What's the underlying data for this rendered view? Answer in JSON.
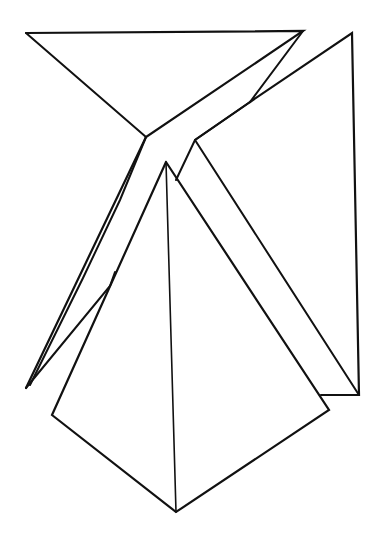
{
  "figure": {
    "title": "",
    "stroke_color": "#111111",
    "background": "#ffffff",
    "shapes": [
      {
        "name": "left-folded-face",
        "stroke": 2.2,
        "points": "26,33 303,31 146,137 26,388"
      },
      {
        "name": "left-face-diagonal",
        "stroke": 2,
        "points": "26,33 146,137"
      },
      {
        "name": "left-strip",
        "stroke": 2,
        "points": "303,31 250,102 195,140 176,180"
      },
      {
        "name": "left-strip-lower",
        "stroke": 2,
        "points": "146,137 120,200 83,278 30,385"
      },
      {
        "name": "left-inner-fold",
        "stroke": 2,
        "points": "26,388 110,286 115,272"
      },
      {
        "name": "right-face",
        "stroke": 2.2,
        "points": "250,102 352,33 359,395 321,395"
      },
      {
        "name": "right-face-diagonal",
        "stroke": 2,
        "points": "195,140 359,395"
      },
      {
        "name": "right-inner-top",
        "stroke": 2,
        "points": "250,102 195,140"
      },
      {
        "name": "pyramid-outline",
        "stroke": 2.2,
        "points": "166,162 52,415 176,512 329,410 166,162"
      },
      {
        "name": "pyramid-ridge",
        "stroke": 1.6,
        "points": "166,162 176,512"
      }
    ]
  }
}
